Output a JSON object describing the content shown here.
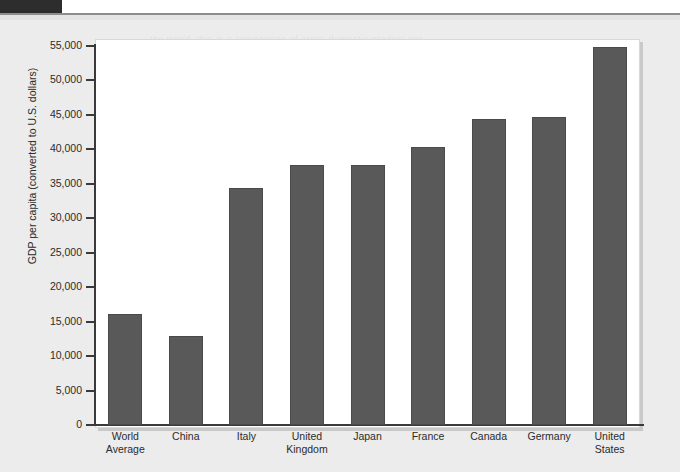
{
  "page": {
    "ghost_lines": [
      "the world, this is a comparison of gross domestic product per",
      "capita across several major economies and the world average.",
      "Figures are converted to U.S. dollars at purchasing power parity.",
      "countries with larger populations do not necessarily produce",
      "more output per person than smaller, wealthier nations do.",
      "As the chart shows, the United States leads this group, while",
      "China remains below the world average on a per person basis."
    ]
  },
  "chart_data": {
    "type": "bar",
    "title": "",
    "xlabel": "",
    "ylabel": "GDP per capita (converted to U.S. dollars)",
    "ylim": [
      0,
      55000
    ],
    "ytick_step": 5000,
    "grid": false,
    "legend": "none",
    "bar_color": "#595959",
    "bar_edge_color": "#4a4a4a",
    "plot_background": "#ffffff",
    "yticks": [
      "0",
      "5,000",
      "10,000",
      "15,000",
      "20,000",
      "25,000",
      "30,000",
      "35,000",
      "40,000",
      "45,000",
      "50,000",
      "55,000"
    ],
    "categories": [
      "World Average",
      "China",
      "Italy",
      "United Kingdom",
      "Japan",
      "France",
      "Canada",
      "Germany",
      "United States"
    ],
    "category_lines": [
      [
        "World",
        "Average"
      ],
      [
        "China",
        ""
      ],
      [
        "Italy",
        ""
      ],
      [
        "United",
        "Kingdom"
      ],
      [
        "Japan",
        ""
      ],
      [
        "France",
        ""
      ],
      [
        "Canada",
        ""
      ],
      [
        "Germany",
        ""
      ],
      [
        "United",
        "States"
      ]
    ],
    "values": [
      16100,
      12900,
      34400,
      37700,
      37800,
      40300,
      44400,
      44700,
      54800
    ]
  }
}
